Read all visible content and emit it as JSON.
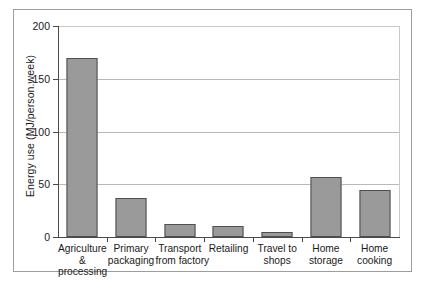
{
  "chart_data": {
    "type": "bar",
    "title": "",
    "xlabel": "",
    "ylabel": "Energy use (MJ/person.week)",
    "ylim": [
      0,
      200
    ],
    "yticks": [
      0,
      50,
      100,
      150,
      200
    ],
    "ytick_labels": [
      "0",
      "50",
      "100",
      "150",
      "200"
    ],
    "grid": true,
    "legend": "none",
    "bar_color": "#9a9a9a",
    "bar_edge_color": "#4f4f4f",
    "categories": [
      "Agriculture & processing",
      "Primary packaging",
      "Transport from factory",
      "Retailing",
      "Travel to shops",
      "Home storage",
      "Home cooking"
    ],
    "category_lines": [
      [
        "Agriculture",
        "&",
        "processing"
      ],
      [
        "Primary",
        "packaging"
      ],
      [
        "Transport",
        "from factory"
      ],
      [
        "Retailing"
      ],
      [
        "Travel to",
        "shops"
      ],
      [
        "Home",
        "storage"
      ],
      [
        "Home",
        "cooking"
      ]
    ],
    "values": [
      170,
      37,
      12,
      10,
      5,
      57,
      45
    ]
  }
}
